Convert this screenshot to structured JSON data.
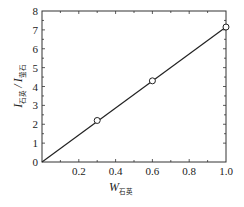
{
  "chart_data": {
    "type": "line",
    "title": "",
    "xlabel": "W石英",
    "xlabel_main": "W",
    "xlabel_sub": "石英",
    "ylabel": "I石英/I萤石",
    "ylabel_main1": "I",
    "ylabel_sub1": "石英",
    "ylabel_sep": "/",
    "ylabel_main2": "I",
    "ylabel_sub2": "萤石",
    "xlim": [
      0,
      1.0
    ],
    "ylim": [
      0,
      8
    ],
    "x_ticks": [
      0.2,
      0.4,
      0.6,
      0.8,
      1.0
    ],
    "x_tick_labels": [
      "0.2",
      "0.4",
      "0.6",
      "0.8",
      "1.0"
    ],
    "y_ticks": [
      0,
      1,
      2,
      3,
      4,
      5,
      6,
      7,
      8
    ],
    "y_tick_labels": [
      "0",
      "1",
      "2",
      "3",
      "4",
      "5",
      "6",
      "7",
      "8"
    ],
    "grid": false,
    "legend": null,
    "series": [
      {
        "name": "fit line",
        "style": "solid line",
        "x": [
          0,
          1.0
        ],
        "y": [
          0,
          7.15
        ]
      },
      {
        "name": "measured",
        "style": "open circle markers",
        "x": [
          0.3,
          0.6,
          1.0
        ],
        "y": [
          2.2,
          4.3,
          7.15
        ]
      }
    ]
  },
  "colors": {
    "axis": "#333333",
    "line": "#222222",
    "marker_fill": "#ffffff",
    "marker_stroke": "#222222"
  }
}
